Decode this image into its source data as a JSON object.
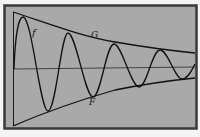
{
  "figure": {
    "background": "#a9a9a9",
    "border_color": "#3a3a3a",
    "stroke_color": "#111111",
    "labels": {
      "f": "f",
      "G": "G",
      "F": "F"
    }
  }
}
